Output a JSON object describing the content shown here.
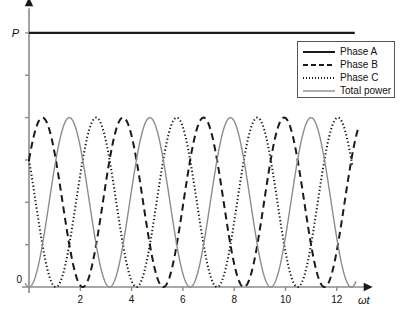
{
  "chart_data": {
    "type": "line",
    "title": "",
    "xlabel": "ωt",
    "ylabel": "P",
    "xlim": [
      -0.25,
      13.4
    ],
    "ylim": [
      -0.28,
      3.35
    ],
    "grid": false,
    "legend_position": "top-right",
    "x_ticks": [
      0,
      2,
      4,
      6,
      8,
      10,
      12
    ],
    "x_tick_labels": [
      "0",
      "2",
      "4",
      "6",
      "8",
      "10",
      "12"
    ],
    "y_ticks": [
      0,
      0.5,
      1.0,
      1.5,
      2.0,
      2.5,
      3.0
    ],
    "y_tick_labels": [
      "",
      "",
      "",
      "",
      "",
      "",
      ""
    ],
    "annotations": [
      {
        "text": "P",
        "x": -0.35,
        "y": 3.0,
        "note": "total power level label"
      },
      {
        "text": "ωt",
        "x": 13.1,
        "y": -0.22,
        "note": "horizontal axis label"
      }
    ],
    "series": [
      {
        "name": "Phase A",
        "style": "solid",
        "color": "#1a1a1a",
        "width": 2.2,
        "kind": "constant",
        "value": 3.0,
        "x_start": 0,
        "x_end": 12.7,
        "note": "constant total power P, drawn as thick horizontal line at top"
      },
      {
        "name": "Phase B",
        "style": "dashed",
        "color": "#1a1a1a",
        "width": 2.0,
        "kind": "sin_squared",
        "amplitude": 1.0,
        "offset": 1.0,
        "phase_deg": 120,
        "period": 3.1416,
        "x_start": 0,
        "x_end": 12.85
      },
      {
        "name": "Phase C",
        "style": "dotted",
        "color": "#1a1a1a",
        "width": 2.0,
        "kind": "sin_squared",
        "amplitude": 1.0,
        "offset": 1.0,
        "phase_deg": 240,
        "period": 3.1416,
        "x_start": 0,
        "x_end": 12.6
      },
      {
        "name": "Total power",
        "style": "solid",
        "color": "#8c8c8c",
        "width": 1.4,
        "kind": "sin_squared",
        "amplitude": 1.0,
        "offset": 1.0,
        "phase_deg": 0,
        "period": 3.1416,
        "x_start": -0.15,
        "x_end": 12.75
      }
    ]
  },
  "legend": {
    "items": [
      {
        "label": "Phase A",
        "style": "solid",
        "color": "#1a1a1a"
      },
      {
        "label": "Phase B",
        "style": "dashed",
        "color": "#1a1a1a"
      },
      {
        "label": "Phase C",
        "style": "dotted",
        "color": "#1a1a1a"
      },
      {
        "label": "Total power",
        "style": "solid",
        "color": "#8c8c8c"
      }
    ]
  },
  "axes": {
    "y_axis_label": "P",
    "x_axis_label": "ωt",
    "axis_color": "#8c8c8c",
    "tick_color": "#8c8c8c"
  }
}
